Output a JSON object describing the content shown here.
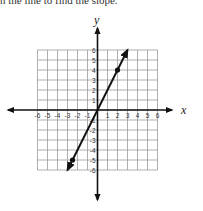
{
  "instruction": "n the line to find the slope.",
  "chart_data": {
    "type": "line",
    "title": "",
    "xlabel": "x",
    "ylabel": "y",
    "xlim": [
      -6,
      6
    ],
    "ylim": [
      -6,
      6
    ],
    "grid": true,
    "x_ticks": [
      "-6",
      "-5",
      "-4",
      "-3",
      "-2",
      "-1",
      "1",
      "2",
      "3",
      "4",
      "5",
      "6"
    ],
    "y_ticks": [
      "6",
      "5",
      "4",
      "3",
      "2",
      "1",
      "-1",
      "-2",
      "-3",
      "-4",
      "-5",
      "-6"
    ],
    "series": [
      {
        "name": "line",
        "x": [
          -3,
          3
        ],
        "y": [
          -6,
          6
        ],
        "arrows": "both",
        "marked_points": [
          {
            "x": 2,
            "y": 4
          },
          {
            "x": -2.5,
            "y": -5
          }
        ]
      }
    ]
  }
}
